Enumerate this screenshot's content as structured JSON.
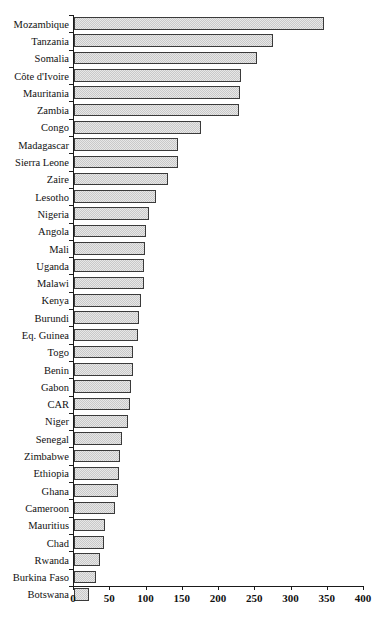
{
  "page": {
    "header_artifact": "",
    "page_number_artifact": ""
  },
  "chart_data": {
    "type": "bar",
    "orientation": "horizontal",
    "title": "",
    "subtitle": "",
    "xlabel": "",
    "ylabel": "",
    "xlim": [
      0,
      400
    ],
    "ylim": null,
    "grid": false,
    "legend": null,
    "legend_position": "none",
    "xticks": [
      0,
      50,
      100,
      150,
      200,
      250,
      300,
      350,
      400
    ],
    "xtick_labels": [
      "0",
      "50",
      "100",
      "150",
      "200",
      "250",
      "300",
      "350",
      "400"
    ],
    "categories": [
      "Mozambique",
      "Tanzania",
      "Somalia",
      "Côte d'Ivoire",
      "Mauritania",
      "Zambia",
      "Congo",
      "Madagascar",
      "Sierra Leone",
      "Zaire",
      "Lesotho",
      "Nigeria",
      "Angola",
      "Mali",
      "Uganda",
      "Malawi",
      "Kenya",
      "Burundi",
      "Eq. Guinea",
      "Togo",
      "Benin",
      "Gabon",
      "CAR",
      "Niger",
      "Senegal",
      "Zimbabwe",
      "Ethiopia",
      "Ghana",
      "Cameroon",
      "Mauritius",
      "Chad",
      "Rwanda",
      "Burkina Faso",
      "Botswana"
    ],
    "values": [
      345,
      275,
      253,
      230,
      229,
      228,
      175,
      144,
      143,
      130,
      113,
      103,
      99,
      98,
      96,
      96,
      92,
      90,
      88,
      82,
      81,
      78,
      77,
      75,
      66,
      63,
      62,
      61,
      57,
      43,
      42,
      36,
      30,
      20
    ],
    "bar_color": "#c9c9c9",
    "bar_edge_color": "#3a3a3a",
    "axis_color": "#1a1a1a"
  }
}
